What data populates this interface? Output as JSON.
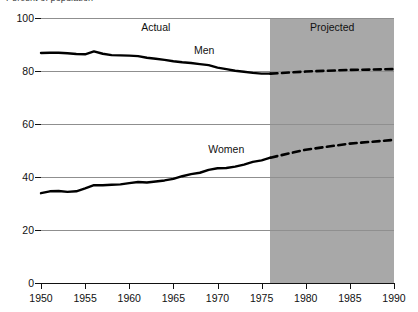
{
  "chart_data": {
    "type": "line",
    "title": "Percent of population",
    "xlabel": "",
    "ylabel": "",
    "xlim": [
      1950,
      1990
    ],
    "ylim": [
      0,
      100
    ],
    "grid": true,
    "legend_position": "inline-annotations",
    "x_ticks": [
      1950,
      1955,
      1960,
      1965,
      1970,
      1975,
      1980,
      1985,
      1990
    ],
    "y_ticks": [
      0,
      20,
      40,
      60,
      80,
      100
    ],
    "annotations": [
      {
        "text": "Actual",
        "x": 1963.0,
        "y": 96.5
      },
      {
        "text": "Projected",
        "x": 1983.0,
        "y": 96.5
      },
      {
        "text": "Men",
        "x": 1968.5,
        "y": 88.0
      },
      {
        "text": "Women",
        "x": 1971.0,
        "y": 50.5
      }
    ],
    "shaded_regions": [
      {
        "label": "Projected",
        "x_start": 1976,
        "x_end": 1990,
        "color": "#a8a8a8"
      }
    ],
    "series": [
      {
        "name": "Men",
        "segment": "actual",
        "style": "solid",
        "x": [
          1950,
          1951,
          1952,
          1953,
          1954,
          1955,
          1956,
          1957,
          1958,
          1959,
          1960,
          1961,
          1962,
          1963,
          1964,
          1965,
          1966,
          1967,
          1968,
          1969,
          1970,
          1971,
          1972,
          1973,
          1974,
          1975,
          1976
        ],
        "values": [
          86.8,
          86.9,
          86.9,
          86.7,
          86.4,
          86.3,
          87.4,
          86.5,
          86.0,
          85.9,
          85.8,
          85.6,
          85.0,
          84.6,
          84.2,
          83.7,
          83.3,
          83.0,
          82.6,
          82.2,
          81.3,
          80.7,
          80.1,
          79.7,
          79.3,
          79.0,
          79.0
        ]
      },
      {
        "name": "Men",
        "segment": "projected",
        "style": "dashed",
        "x": [
          1976,
          1980,
          1985,
          1990
        ],
        "values": [
          79.0,
          79.8,
          80.4,
          80.7
        ]
      },
      {
        "name": "Women",
        "segment": "actual",
        "style": "solid",
        "x": [
          1950,
          1951,
          1952,
          1953,
          1954,
          1955,
          1956,
          1957,
          1958,
          1959,
          1960,
          1961,
          1962,
          1963,
          1964,
          1965,
          1966,
          1967,
          1968,
          1969,
          1970,
          1971,
          1972,
          1973,
          1974,
          1975,
          1976
        ],
        "values": [
          33.9,
          34.6,
          34.7,
          34.4,
          34.6,
          35.7,
          36.9,
          36.9,
          37.1,
          37.2,
          37.7,
          38.1,
          37.9,
          38.3,
          38.7,
          39.3,
          40.3,
          41.1,
          41.6,
          42.7,
          43.3,
          43.4,
          43.9,
          44.7,
          45.7,
          46.3,
          47.3
        ]
      },
      {
        "name": "Women",
        "segment": "projected",
        "style": "dashed",
        "x": [
          1976,
          1980,
          1985,
          1990
        ],
        "values": [
          47.3,
          50.3,
          52.6,
          54.0
        ]
      }
    ]
  }
}
